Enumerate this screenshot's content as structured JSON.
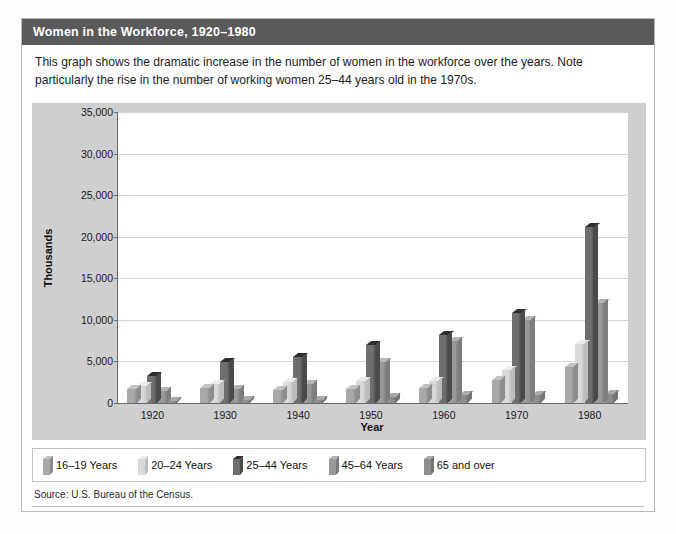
{
  "figure": {
    "title": "Women in the Workforce, 1920–1980",
    "caption": "This graph shows the dramatic increase in the number of women in the workforce over the years. Note particularly the rise in the number of working women 25–44 years old in the 1970s.",
    "source": "Source: U.S. Bureau of the Census.",
    "colors": {
      "title_bar": "#5a5a5a",
      "panel_bg": "#cfcfcf",
      "plot_bg": "#ffffff",
      "gridline": "#d4d4d4",
      "axis": "#6a6a6a",
      "frame_border": "#b9b9b9"
    }
  },
  "chart_data": {
    "type": "bar",
    "title": "Women in the Workforce, 1920–1980",
    "xlabel": "Year",
    "ylabel": "Thousands",
    "ylim": [
      0,
      35000
    ],
    "yticks": [
      0,
      5000,
      10000,
      15000,
      20000,
      25000,
      30000,
      35000
    ],
    "ytick_labels": [
      "0",
      "5,000",
      "10,000",
      "15,000",
      "20,000",
      "25,000",
      "30,000",
      "35,000"
    ],
    "grid": true,
    "legend_position": "bottom",
    "categories": [
      "1920",
      "1930",
      "1940",
      "1950",
      "1960",
      "1970",
      "1980"
    ],
    "series": [
      {
        "name": "16–19 Years",
        "color": "#a8a8a8",
        "top_color": "#c2c2c2",
        "side_color": "#8d8d8d",
        "values": [
          1700,
          1800,
          1600,
          1700,
          1800,
          2800,
          4300
        ]
      },
      {
        "name": "20–24 Years",
        "color": "#d9d9d9",
        "top_color": "#ececec",
        "side_color": "#bdbdbd",
        "values": [
          2100,
          2300,
          2500,
          2600,
          2600,
          4000,
          7100
        ]
      },
      {
        "name": "25–44 Years",
        "color": "#6e6e6e",
        "top_color": "#2e2e2e",
        "side_color": "#4a4a4a",
        "values": [
          3200,
          4900,
          5500,
          7000,
          8200,
          10800,
          21200
        ]
      },
      {
        "name": "45–64 Years",
        "color": "#999999",
        "top_color": "#b5b5b5",
        "side_color": "#7d7d7d",
        "values": [
          1400,
          1700,
          2300,
          4900,
          7500,
          10000,
          12000
        ]
      },
      {
        "name": "65 and over",
        "color": "#8f8f8f",
        "top_color": "#aaaaaa",
        "side_color": "#747474",
        "values": [
          300,
          400,
          400,
          700,
          1000,
          1000,
          1100
        ]
      }
    ]
  }
}
